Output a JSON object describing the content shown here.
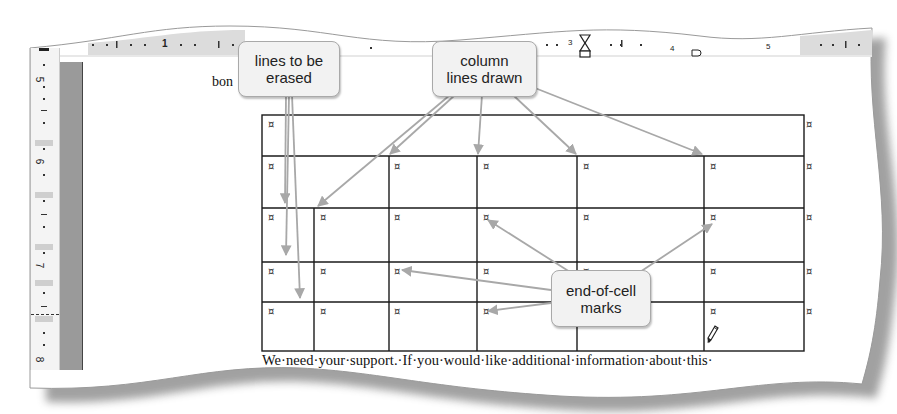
{
  "document": {
    "partial_word": "bon",
    "body_text": "We·need·your·support.·If·you·would·like·additional·information·about·this·",
    "end_of_cell_mark": "¤"
  },
  "rulers": {
    "horizontal_labels": [
      "1",
      "3",
      "4",
      "5"
    ],
    "vertical_labels": [
      "5",
      "6",
      "7",
      "8"
    ]
  },
  "table": {
    "columns_x": [
      262,
      314,
      389,
      477,
      577,
      704,
      804
    ],
    "rows_y": [
      115,
      156,
      208,
      262,
      302,
      351
    ],
    "rows": [
      {
        "cells": 1,
        "marks": [
          "¤"
        ]
      },
      {
        "cells": 5,
        "marks": [
          "¤",
          "¤",
          "¤",
          "¤",
          "¤"
        ]
      },
      {
        "cells": 6,
        "marks": [
          "¤",
          "¤",
          "¤",
          "¤",
          "¤",
          "¤"
        ]
      },
      {
        "cells": 6,
        "marks": [
          "¤",
          "¤",
          "¤",
          "¤",
          "¤",
          "¤"
        ]
      },
      {
        "cells": 6,
        "marks": [
          "¤",
          "¤",
          "¤",
          "¤",
          "¤",
          "¤"
        ]
      }
    ],
    "row_end_marks": [
      "¤",
      "¤",
      "¤",
      "¤",
      "¤"
    ]
  },
  "callouts": [
    {
      "id": "lines-to-be-erased",
      "line1": "lines to be",
      "line2": "erased"
    },
    {
      "id": "column-lines-drawn",
      "line1": "column",
      "line2": "lines drawn"
    },
    {
      "id": "end-of-cell-marks",
      "line1": "end-of-cell",
      "line2": "marks"
    }
  ],
  "icons": {
    "pencil": "draw-table-pencil-icon",
    "tab_marker": "hourglass-indent-marker-icon"
  },
  "colors": {
    "arrow": "#a8a8a8",
    "callout_bg": "#f2f2f2",
    "callout_border": "#a9a9a9",
    "grid": "#1a1a1a",
    "ruler_gray": "#9a9a9a"
  }
}
